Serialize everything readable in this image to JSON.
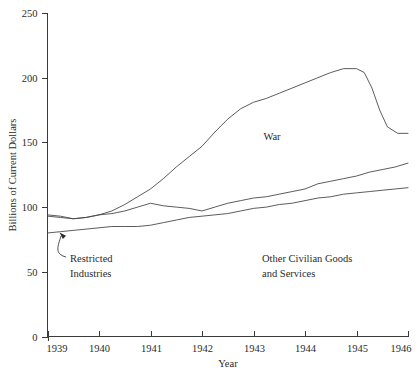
{
  "chart_data": {
    "type": "line",
    "title": "",
    "xlabel": "Year",
    "ylabel": "Billions of Current Dollars",
    "xlim": [
      1939,
      1946
    ],
    "ylim": [
      0,
      250
    ],
    "grid": false,
    "legend": "inline-annotations",
    "y_ticks": [
      0,
      50,
      100,
      150,
      200,
      250
    ],
    "y_tick_labels": [
      "0",
      "50",
      "100",
      "150",
      "200",
      "250"
    ],
    "x_ticks": [
      1939,
      1940,
      1941,
      1942,
      1943,
      1944,
      1945,
      1946
    ],
    "x_tick_labels": [
      "1939",
      "1940",
      "1941",
      "1942",
      "1943",
      "1944",
      "1945",
      "1946"
    ],
    "series": [
      {
        "name": "War",
        "label": "War",
        "x": [
          1939.0,
          1939.25,
          1939.5,
          1939.75,
          1940.0,
          1940.25,
          1940.5,
          1940.75,
          1941.0,
          1941.25,
          1941.5,
          1941.75,
          1942.0,
          1942.25,
          1942.5,
          1942.75,
          1943.0,
          1943.25,
          1943.5,
          1943.75,
          1944.0,
          1944.25,
          1944.5,
          1944.75,
          1945.0,
          1945.15,
          1945.3,
          1945.45,
          1945.6,
          1945.8,
          1946.0
        ],
        "values": [
          94,
          93,
          91,
          92,
          94,
          97,
          102,
          108,
          114,
          122,
          131,
          139,
          147,
          158,
          168,
          176,
          181,
          184,
          188,
          192,
          196,
          200,
          204,
          207,
          207,
          204,
          192,
          175,
          162,
          157,
          157
        ]
      },
      {
        "name": "Other Civilian Goods and Services",
        "label": "Other Civilian Goods and Services",
        "x": [
          1939.0,
          1939.25,
          1939.5,
          1939.75,
          1940.0,
          1940.25,
          1940.5,
          1940.75,
          1941.0,
          1941.25,
          1941.5,
          1941.75,
          1942.0,
          1942.25,
          1942.5,
          1942.75,
          1943.0,
          1943.25,
          1943.5,
          1943.75,
          1944.0,
          1944.25,
          1944.5,
          1944.75,
          1945.0,
          1945.25,
          1945.5,
          1945.75,
          1946.0
        ],
        "values": [
          93,
          92,
          91,
          92,
          94,
          95,
          97,
          100,
          103,
          101,
          100,
          99,
          97,
          100,
          103,
          105,
          107,
          108,
          110,
          112,
          114,
          118,
          120,
          122,
          124,
          127,
          129,
          131,
          134
        ]
      },
      {
        "name": "Restricted Industries",
        "label": "Restricted Industries",
        "x": [
          1939.0,
          1939.25,
          1939.5,
          1939.75,
          1940.0,
          1940.25,
          1940.5,
          1940.75,
          1941.0,
          1941.25,
          1941.5,
          1941.75,
          1942.0,
          1942.25,
          1942.5,
          1942.75,
          1943.0,
          1943.25,
          1943.5,
          1943.75,
          1944.0,
          1944.25,
          1944.5,
          1944.75,
          1945.0,
          1945.25,
          1945.5,
          1945.75,
          1946.0
        ],
        "values": [
          80,
          81,
          82,
          83,
          84,
          85,
          85,
          85,
          86,
          88,
          90,
          92,
          93,
          94,
          95,
          97,
          99,
          100,
          102,
          103,
          105,
          107,
          108,
          110,
          111,
          112,
          113,
          114,
          115
        ]
      }
    ],
    "annotations": [
      {
        "name": "restricted-industries",
        "text_line1": "Restricted",
        "text_line2": "Industries",
        "text_x": 70,
        "text_y": 262,
        "arrow_tip_x": 57,
        "arrow_tip_y": 231
      },
      {
        "name": "war",
        "text_line1": "War",
        "text_line2": "",
        "text_x": 272,
        "text_y": 140
      },
      {
        "name": "other-civilian",
        "text_line1": "Other Civilian Goods",
        "text_line2": "and Services",
        "text_x": 262,
        "text_y": 262
      }
    ],
    "colors": {
      "background": "#ffffff",
      "line": "#4a4a4a",
      "axis": "#3a3a3a",
      "text": "#2b2b2b"
    }
  }
}
